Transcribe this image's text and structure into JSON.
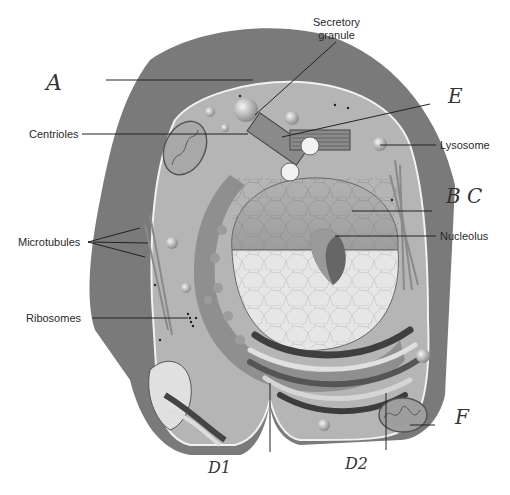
{
  "diagram": {
    "printed_labels": [
      {
        "id": "secretory-granule",
        "line1": "Secretory",
        "line2": "granule"
      },
      {
        "id": "centrioles",
        "text": "Centrioles"
      },
      {
        "id": "lysosome",
        "text": "Lysosome"
      },
      {
        "id": "microtubules",
        "text": "Microtubules"
      },
      {
        "id": "nucleolus",
        "text": "Nucleolus"
      },
      {
        "id": "ribosomes",
        "text": "Ribosomes"
      }
    ],
    "handwritten_labels": [
      {
        "id": "A",
        "text": "A"
      },
      {
        "id": "E",
        "text": "E"
      },
      {
        "id": "BC",
        "text": "B C"
      },
      {
        "id": "F",
        "text": "F"
      },
      {
        "id": "D1",
        "text": "D1"
      },
      {
        "id": "D2",
        "text": "D2"
      }
    ],
    "colors": {
      "outer_membrane": "#7a7a7a",
      "cytoplasm": "#b5b5b5",
      "nucleus_dark": "#a9a9a9",
      "nucleus_light": "#e6e6e6",
      "organelle_dark": "#4d4d4d",
      "leader_line": "#222222"
    }
  }
}
